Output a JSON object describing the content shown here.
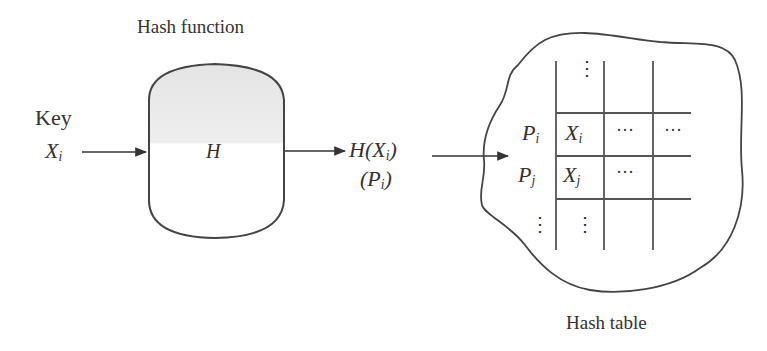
{
  "diagram": {
    "hash_function": {
      "title": "Hash function",
      "symbol": "H"
    },
    "input": {
      "label": "Key",
      "var": "X",
      "sub": "i"
    },
    "output": {
      "func": "H(X",
      "func_sub": "i",
      "func_close": ")",
      "alt_open": "(P",
      "alt_sub": "i",
      "alt_close": ")"
    },
    "hash_table": {
      "title": "Hash table",
      "rows": [
        {
          "pointer": "",
          "cells": [
            "⋮",
            "",
            ""
          ]
        },
        {
          "pointer": "P",
          "pointer_sub": "i",
          "cells": [
            "X",
            "…",
            "…"
          ],
          "cell_sub": "i"
        },
        {
          "pointer": "P",
          "pointer_sub": "j",
          "cells": [
            "X",
            "…",
            ""
          ],
          "cell_sub": "j"
        },
        {
          "pointer": "⋮",
          "cells": [
            "⋮",
            "",
            ""
          ]
        }
      ],
      "dots": {
        "v": "⋮",
        "h": "···"
      }
    },
    "colors": {
      "stroke": "#444444",
      "fill_top": "#e9e9e9",
      "text": "#333333"
    }
  }
}
